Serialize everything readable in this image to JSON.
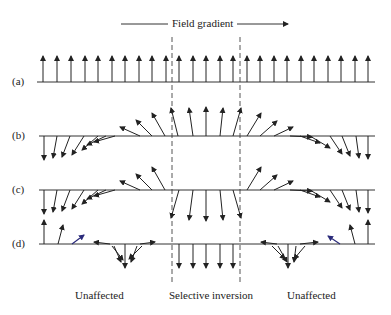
{
  "diagram": {
    "title": "Field gradient",
    "rows": [
      {
        "label": "(a)"
      },
      {
        "label": "(b)"
      },
      {
        "label": "(c)"
      },
      {
        "label": "(d)"
      }
    ],
    "region_labels": {
      "left": "Unaffected",
      "center": "Selective inversion",
      "right": "Unaffected"
    },
    "colors": {
      "line": "#333333",
      "dashed": "#555555",
      "highlight_arrow": "#2a2a7a"
    }
  }
}
